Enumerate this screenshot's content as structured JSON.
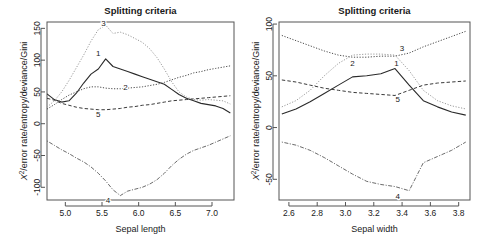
{
  "figure": {
    "background": "#ffffff",
    "panel_count": 2
  },
  "chart_data": [
    {
      "id": "left",
      "type": "line",
      "title": "Splitting criteria",
      "xlabel": "Sepal length",
      "ylabel": "X²/error rate/entropy/deviance/Gini",
      "ylabel_parts": {
        "chi": "X",
        "sup": "2",
        "rest": "/error rate/entropy/deviance/Gini"
      },
      "xlim": [
        4.75,
        7.3
      ],
      "ylim": [
        -120,
        160
      ],
      "xticks": [
        5.0,
        5.5,
        6.0,
        6.5,
        7.0
      ],
      "xticklabels": [
        "5.0",
        "5.5",
        "6.0",
        "6.5",
        "7.0"
      ],
      "yticks": [
        -100,
        -50,
        0,
        50,
        100,
        150
      ],
      "yticklabels": [
        "-100",
        "-50",
        "0",
        "50",
        "100",
        "150"
      ],
      "grid": false,
      "legend": "inline-curve-labels",
      "x": [
        4.75,
        4.85,
        4.95,
        5.05,
        5.15,
        5.25,
        5.35,
        5.45,
        5.55,
        5.65,
        5.75,
        5.85,
        5.95,
        6.05,
        6.15,
        6.25,
        6.35,
        6.45,
        6.55,
        6.65,
        6.75,
        6.85,
        6.95,
        7.05,
        7.15,
        7.25
      ],
      "series": [
        {
          "name": "1",
          "style": "solid",
          "color": "#2a2a2a",
          "label_x": 5.45,
          "label_y": 110,
          "values": [
            47,
            38,
            34,
            36,
            48,
            64,
            78,
            86,
            102,
            90,
            86,
            82,
            78,
            74,
            70,
            66,
            62,
            54,
            46,
            40,
            36,
            32,
            30,
            28,
            24,
            17
          ]
        },
        {
          "name": "2",
          "style": "dotted",
          "color": "#4a4a4a",
          "label_x": 5.82,
          "label_y": 57,
          "values": [
            23,
            30,
            38,
            45,
            50,
            55,
            58,
            58,
            56,
            55,
            55,
            56,
            57,
            58,
            60,
            62,
            65,
            69,
            73,
            76,
            80,
            82,
            85,
            87,
            89,
            91
          ]
        },
        {
          "name": "3",
          "style": "dotted-light",
          "color": "#9a9a9a",
          "label_x": 5.52,
          "label_y": 158,
          "values": [
            26,
            36,
            50,
            68,
            88,
            108,
            130,
            148,
            155,
            142,
            144,
            140,
            134,
            128,
            118,
            104,
            86,
            66,
            50,
            42,
            38,
            37,
            38,
            37,
            36,
            31
          ]
        },
        {
          "name": "4",
          "style": "dotdash",
          "color": "#5a5a5a",
          "label_x": 5.58,
          "label_y": -120,
          "values": [
            -27,
            -34,
            -41,
            -47,
            -54,
            -60,
            -68,
            -78,
            -90,
            -104,
            -113,
            -106,
            -103,
            -100,
            -95,
            -88,
            -78,
            -66,
            -56,
            -48,
            -42,
            -38,
            -34,
            -29,
            -24,
            -19
          ]
        },
        {
          "name": "5",
          "style": "dashed",
          "color": "#3a3a3a",
          "label_x": 5.45,
          "label_y": 15,
          "values": [
            40,
            37,
            32,
            29,
            26,
            24,
            23,
            22,
            22,
            23,
            24,
            26,
            27,
            29,
            30,
            32,
            34,
            36,
            37,
            38,
            39,
            40,
            41,
            42,
            43,
            44
          ]
        }
      ]
    },
    {
      "id": "right",
      "type": "line",
      "title": "Splitting criteria",
      "xlabel": "Sepal width",
      "ylabel": "X²/error rate/entropy/deviance/Gini",
      "ylabel_parts": {
        "chi": "X",
        "sup": "2",
        "rest": "/error rate/entropy/deviance/Gini"
      },
      "xlim": [
        2.53,
        3.88
      ],
      "ylim": [
        -70,
        102
      ],
      "xticks": [
        2.6,
        2.8,
        3.0,
        3.2,
        3.4,
        3.6,
        3.8
      ],
      "xticklabels": [
        "2.6",
        "2.8",
        "3.0",
        "3.2",
        "3.4",
        "3.6",
        "3.8"
      ],
      "yticks": [
        -50,
        0,
        50,
        100
      ],
      "yticklabels": [
        "-50",
        "0",
        "50",
        "100"
      ],
      "grid": false,
      "legend": "inline-curve-labels",
      "x": [
        2.55,
        2.65,
        2.75,
        2.85,
        2.95,
        3.05,
        3.15,
        3.25,
        3.35,
        3.45,
        3.55,
        3.65,
        3.75,
        3.85
      ],
      "series": [
        {
          "name": "1",
          "style": "solid",
          "color": "#2a2a2a",
          "label_x": 3.36,
          "label_y": 62,
          "values": [
            13,
            18,
            25,
            33,
            41,
            49,
            50,
            52,
            57,
            41,
            26,
            20,
            15,
            12
          ]
        },
        {
          "name": "2",
          "style": "dotted",
          "color": "#4a4a4a",
          "label_x": 3.05,
          "label_y": 62,
          "values": [
            89,
            84,
            79,
            74,
            70,
            68,
            68,
            69,
            69,
            72,
            78,
            83,
            88,
            93
          ]
        },
        {
          "name": "3",
          "style": "dotted-light",
          "color": "#9a9a9a",
          "label_x": 3.4,
          "label_y": 76,
          "values": [
            20,
            26,
            36,
            50,
            62,
            70,
            71,
            71,
            70,
            55,
            36,
            26,
            21,
            18
          ]
        },
        {
          "name": "4",
          "style": "dotdash",
          "color": "#5a5a5a",
          "label_x": 3.37,
          "label_y": -67,
          "values": [
            -14,
            -17,
            -22,
            -29,
            -37,
            -45,
            -52,
            -55,
            -57,
            -61,
            -34,
            -28,
            -22,
            -14
          ]
        },
        {
          "name": "5",
          "style": "dashed",
          "color": "#3a3a3a",
          "label_x": 3.37,
          "label_y": 27,
          "values": [
            46,
            44,
            41,
            38,
            36,
            34,
            33,
            32,
            31,
            36,
            41,
            43,
            44,
            45
          ]
        }
      ]
    }
  ]
}
